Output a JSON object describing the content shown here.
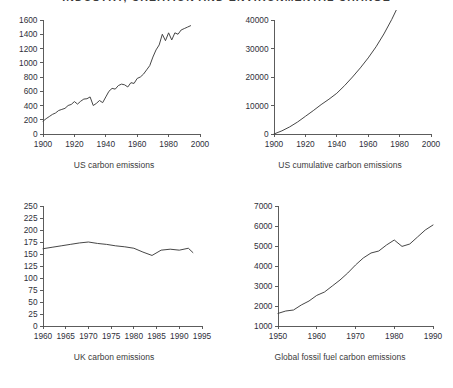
{
  "page_title": "INDUSTRY, CREATION AND ENVIRONMENTAL CHANGE",
  "colors": {
    "background": "#ffffff",
    "axis": "#4a4a4a",
    "series": "#3c3c3c",
    "label": "#2f2f3a",
    "caption": "#3b3b3b"
  },
  "captions": {
    "top_left": "US carbon emissions",
    "top_right": "US cumulative carbon emissions",
    "bottom_left": "UK carbon emissions",
    "bottom_right": "Global fossil fuel carbon emissions"
  },
  "chart_data": [
    {
      "id": "us-carbon-emissions",
      "type": "line",
      "title": "US carbon emissions",
      "xlabel": "",
      "ylabel": "",
      "xlim": [
        1900,
        2000
      ],
      "ylim": [
        0,
        1600
      ],
      "xticks": [
        1900,
        1920,
        1940,
        1960,
        1980,
        2000
      ],
      "yticks": [
        0,
        200,
        400,
        600,
        800,
        1000,
        1200,
        1400,
        1600
      ],
      "grid": false,
      "legend": false,
      "x": [
        1900,
        1902,
        1904,
        1906,
        1908,
        1910,
        1912,
        1914,
        1916,
        1918,
        1920,
        1922,
        1924,
        1926,
        1928,
        1930,
        1932,
        1934,
        1936,
        1938,
        1940,
        1942,
        1944,
        1946,
        1948,
        1950,
        1952,
        1954,
        1956,
        1958,
        1960,
        1962,
        1964,
        1966,
        1968,
        1970,
        1972,
        1974,
        1976,
        1978,
        1980,
        1982,
        1984,
        1986,
        1988,
        1990,
        1992,
        1994
      ],
      "values": [
        180,
        215,
        245,
        275,
        295,
        330,
        345,
        360,
        400,
        415,
        455,
        420,
        460,
        490,
        495,
        520,
        400,
        430,
        470,
        440,
        520,
        600,
        640,
        630,
        680,
        700,
        690,
        660,
        720,
        710,
        780,
        800,
        840,
        900,
        960,
        1080,
        1180,
        1250,
        1400,
        1310,
        1420,
        1320,
        1420,
        1400,
        1460,
        1480,
        1500,
        1520
      ]
    },
    {
      "id": "us-cumulative-carbon-emissions",
      "type": "line",
      "title": "US cumulative carbon emissions",
      "xlabel": "",
      "ylabel": "",
      "xlim": [
        1900,
        2000
      ],
      "ylim": [
        0,
        40000
      ],
      "xticks": [
        1900,
        1920,
        1940,
        1960,
        1980,
        2000
      ],
      "yticks": [
        0,
        10000,
        20000,
        30000,
        40000
      ],
      "grid": false,
      "legend": false,
      "x": [
        1900,
        1905,
        1910,
        1915,
        1920,
        1925,
        1930,
        1935,
        1940,
        1945,
        1950,
        1955,
        1960,
        1965,
        1970,
        1975,
        1980,
        1985,
        1990,
        1993
      ],
      "values": [
        0,
        1100,
        2500,
        4200,
        6200,
        8200,
        10300,
        12200,
        14300,
        17000,
        20000,
        23200,
        26700,
        30600,
        35100,
        40200,
        45900,
        51800,
        58000,
        61600
      ]
    },
    {
      "id": "uk-carbon-emissions",
      "type": "line",
      "title": "UK carbon emissions",
      "xlabel": "",
      "ylabel": "",
      "xlim": [
        1960,
        1995
      ],
      "ylim": [
        0,
        250
      ],
      "xticks": [
        1960,
        1965,
        1970,
        1975,
        1980,
        1985,
        1990,
        1995
      ],
      "yticks": [
        0,
        25,
        50,
        75,
        100,
        125,
        150,
        175,
        200,
        225,
        250
      ],
      "grid": false,
      "legend": false,
      "x": [
        1960,
        1962,
        1964,
        1966,
        1968,
        1970,
        1972,
        1974,
        1976,
        1978,
        1980,
        1982,
        1984,
        1986,
        1988,
        1990,
        1992,
        1993
      ],
      "values": [
        161,
        164,
        167,
        170,
        173,
        175,
        172,
        170,
        167,
        165,
        162,
        154,
        147,
        158,
        160,
        158,
        162,
        153
      ]
    },
    {
      "id": "global-fossil-fuel-carbon-emissions",
      "type": "line",
      "title": "Global fossil fuel carbon emissions",
      "xlabel": "",
      "ylabel": "",
      "xlim": [
        1950,
        1990
      ],
      "ylim": [
        1000,
        7000
      ],
      "xticks": [
        1950,
        1960,
        1970,
        1980,
        1990
      ],
      "yticks": [
        1000,
        2000,
        3000,
        4000,
        5000,
        6000,
        7000
      ],
      "grid": false,
      "legend": false,
      "x": [
        1950,
        1952,
        1954,
        1956,
        1958,
        1960,
        1962,
        1964,
        1966,
        1968,
        1970,
        1972,
        1974,
        1976,
        1978,
        1980,
        1982,
        1984,
        1986,
        1988,
        1990
      ],
      "values": [
        1630,
        1750,
        1800,
        2050,
        2250,
        2530,
        2700,
        3000,
        3300,
        3650,
        4050,
        4400,
        4650,
        4750,
        5050,
        5300,
        4980,
        5100,
        5450,
        5800,
        6050
      ]
    }
  ]
}
